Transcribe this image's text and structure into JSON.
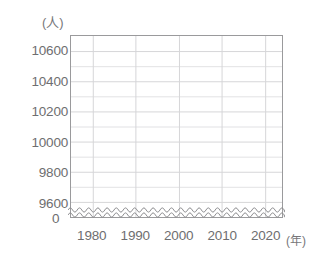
{
  "chart_data": {
    "type": "line",
    "title": "",
    "subtitle": "",
    "xlabel": "(年)",
    "ylabel": "(人)",
    "y_unit": "(人)",
    "x_unit": "(年)",
    "x": [
      1975,
      1980,
      1985,
      1990,
      1995,
      2000,
      2005,
      2010,
      2015,
      2020,
      2023
    ],
    "values": [
      9480,
      9480,
      9480,
      9480,
      9480,
      9480,
      9480,
      9480,
      9480,
      9480,
      9480
    ],
    "series": [
      {
        "name": "人口",
        "values": [
          9480,
          9480,
          9480,
          9480,
          9480,
          9480,
          9480,
          9480,
          9480,
          9480,
          9480
        ]
      }
    ],
    "y_ticks": [
      9600,
      9800,
      10000,
      10200,
      10400,
      10600
    ],
    "y_tick_labels": [
      "9600",
      "9800",
      "10000",
      "10200",
      "10400",
      "10600"
    ],
    "zero_label": "0",
    "x_ticks": [
      1980,
      1990,
      2000,
      2010,
      2020
    ],
    "x_tick_labels": [
      "1980",
      "1990",
      "2000",
      "2010",
      "2020"
    ],
    "xlim": [
      1975,
      2024
    ],
    "ylim": [
      9500,
      10700
    ],
    "grid": true,
    "minor_y_gridlines": true,
    "legend": "none",
    "axis_break": true,
    "axis_break_symbol": "wavy-double-line",
    "colors": {
      "grid": "#d8d8da",
      "minor_grid": "#e4e4e6",
      "frame": "#9a9a9c",
      "text": "#6e6e70",
      "line": "#8a8a8c",
      "background": "#ffffff"
    }
  },
  "axes": {
    "y_unit_label": "(人)",
    "x_unit_label": "(年)",
    "zero_tick": "0"
  }
}
